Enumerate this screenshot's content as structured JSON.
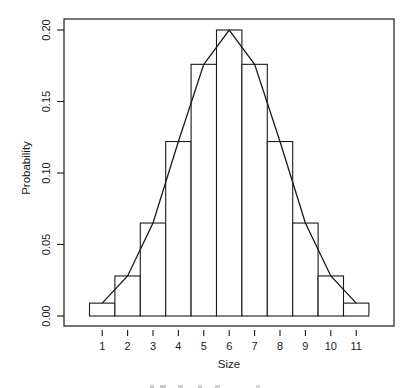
{
  "chart_data": {
    "type": "bar",
    "overlay": "line",
    "title": "",
    "xlabel": "Size",
    "ylabel": "Probability",
    "categories": [
      "1",
      "2",
      "3",
      "4",
      "5",
      "6",
      "7",
      "8",
      "9",
      "10",
      "11"
    ],
    "x": [
      1,
      2,
      3,
      4,
      5,
      6,
      7,
      8,
      9,
      10,
      11
    ],
    "series": [
      {
        "name": "histogram",
        "kind": "bar",
        "values": [
          0.009,
          0.028,
          0.065,
          0.122,
          0.176,
          0.2,
          0.176,
          0.122,
          0.065,
          0.028,
          0.009
        ]
      },
      {
        "name": "frequency polygon",
        "kind": "line",
        "values": [
          0.009,
          0.028,
          0.065,
          0.122,
          0.176,
          0.2,
          0.176,
          0.122,
          0.065,
          0.028,
          0.009
        ]
      }
    ],
    "yticks": [
      0.0,
      0.05,
      0.1,
      0.15,
      0.2
    ],
    "ytick_labels": [
      "0.00",
      "0.05",
      "0.10",
      "0.15",
      "0.20"
    ],
    "ylim": [
      0,
      0.2
    ],
    "xlim": [
      0.5,
      11.5
    ],
    "grid": false,
    "legend": null,
    "colors": {
      "bar_fill": "#ffffff",
      "bar_stroke": "#1a1a1a",
      "line": "#1a1a1a",
      "frame": "#1a1a1a"
    }
  }
}
